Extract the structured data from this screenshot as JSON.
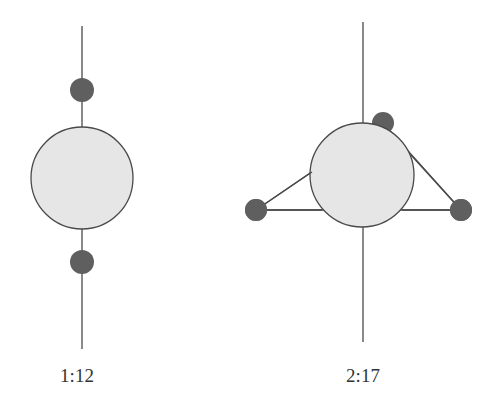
{
  "colors": {
    "line": "#4a4a4a",
    "big_circle_fill": "#e6e6e6",
    "big_circle_stroke": "#4a4a4a",
    "small_circle_fill": "#5f5f5f",
    "label": "#333333"
  },
  "diagrams": [
    {
      "label": "1:12",
      "description": "Vertical axis through a large central sphere with two small spheres above and below (linear arrangement)"
    },
    {
      "label": "2:17",
      "description": "Vertical axis through a large central sphere with three small spheres forming a triangle around it"
    }
  ]
}
